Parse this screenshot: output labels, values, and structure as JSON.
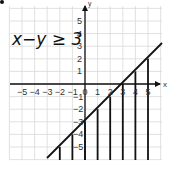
{
  "problem": {
    "inequality": "x−y ≥ 3",
    "boundary_line": "y = x − 3",
    "shaded_region": "below the line (y ≤ x − 3)"
  },
  "axes": {
    "x_label": "x",
    "y_label": "y",
    "x_ticks": [
      "−5",
      "−4",
      "−3",
      "−2",
      "−1",
      "0",
      "1",
      "2",
      "3",
      "4",
      "5"
    ],
    "y_ticks_positive": [
      "1",
      "2",
      "3",
      "4",
      "5"
    ],
    "y_ticks_negative": [
      "−1",
      "−2",
      "−3",
      "−4",
      "−5"
    ],
    "range": {
      "x": [
        -6,
        6
      ],
      "y": [
        -6,
        6
      ]
    }
  },
  "colors": {
    "grid": "#d9d9d9",
    "axis": "#111111",
    "ink": "#111111",
    "background": "#ffffff"
  },
  "shading_x_positions": [
    -2,
    -1,
    0,
    1,
    2,
    3,
    4,
    5
  ]
}
